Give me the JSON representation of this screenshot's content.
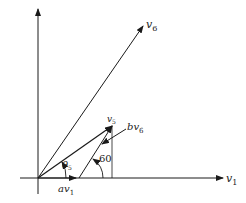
{
  "diagram": {
    "type": "vector-decomposition",
    "colors": {
      "stroke": "#1a1a1a",
      "background": "#ffffff"
    },
    "labels": {
      "v1": {
        "base": "v",
        "sub": "1"
      },
      "v6": {
        "base": "v",
        "sub": "6"
      },
      "v5": {
        "base": "v",
        "sub": "5"
      },
      "av1": {
        "base": "av",
        "sub": "1"
      },
      "bv6": {
        "base": "bv",
        "sub": "6"
      },
      "theta5": {
        "base": "θ",
        "sub": "5"
      },
      "angle60": "60"
    }
  }
}
